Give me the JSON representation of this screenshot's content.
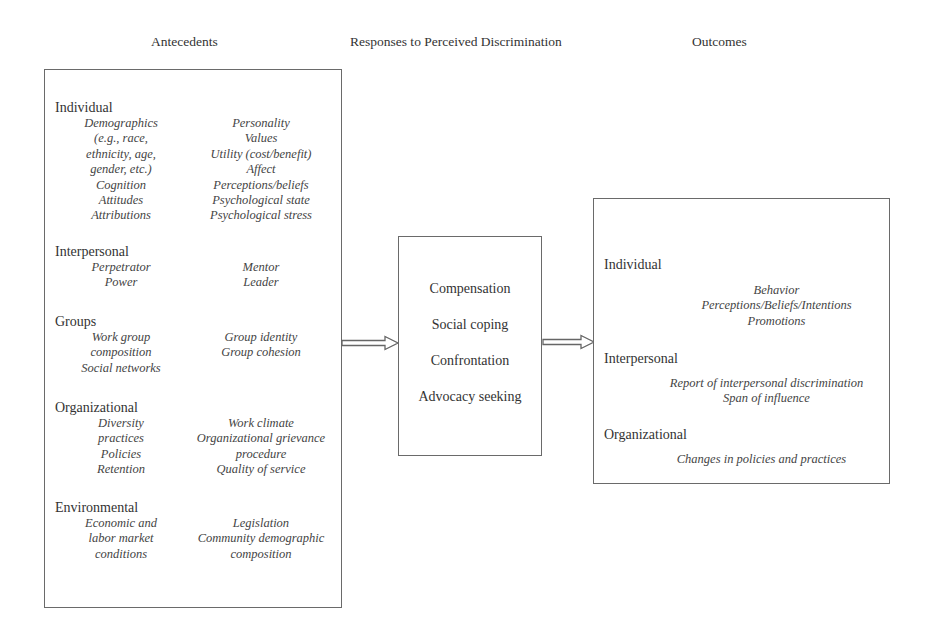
{
  "headers": {
    "antecedents": "Antecedents",
    "responses": "Responses to Perceived Discrimination",
    "outcomes": "Outcomes"
  },
  "antecedents": {
    "individual": {
      "label": "Individual",
      "left": [
        "Demographics",
        "(e.g., race,",
        "ethnicity, age,",
        "gender, etc.)",
        "Cognition",
        "Attitudes",
        "Attributions"
      ],
      "right": [
        "Personality",
        "Values",
        "Utility (cost/benefit)",
        "Affect",
        "Perceptions/beliefs",
        "Psychological state",
        "Psychological stress"
      ]
    },
    "interpersonal": {
      "label": "Interpersonal",
      "left": [
        "Perpetrator",
        "Power"
      ],
      "right": [
        "Mentor",
        "Leader"
      ]
    },
    "groups": {
      "label": "Groups",
      "left": [
        "Work group",
        "composition",
        "Social networks"
      ],
      "right": [
        "Group identity",
        "Group cohesion"
      ]
    },
    "organizational": {
      "label": "Organizational",
      "left": [
        "Diversity",
        "practices",
        "Policies",
        "Retention"
      ],
      "right": [
        "Work climate",
        "Organizational grievance",
        "procedure",
        "Quality of service"
      ]
    },
    "environmental": {
      "label": "Environmental",
      "left": [
        "Economic and",
        "labor market",
        "conditions"
      ],
      "right": [
        "Legislation",
        "Community demographic",
        "composition"
      ]
    }
  },
  "responses": [
    "Compensation",
    "Social coping",
    "Confrontation",
    "Advocacy seeking"
  ],
  "outcomes": {
    "individual": {
      "label": "Individual",
      "items": [
        "Behavior",
        "Perceptions/Beliefs/Intentions",
        "Promotions"
      ]
    },
    "interpersonal": {
      "label": "Interpersonal",
      "items": [
        "Report of interpersonal discrimination",
        "Span of influence"
      ]
    },
    "organizational": {
      "label": "Organizational",
      "items": [
        "Changes in policies and practices"
      ]
    }
  },
  "colors": {
    "border": "#6a6a6a",
    "text": "#333333",
    "background": "#ffffff"
  }
}
